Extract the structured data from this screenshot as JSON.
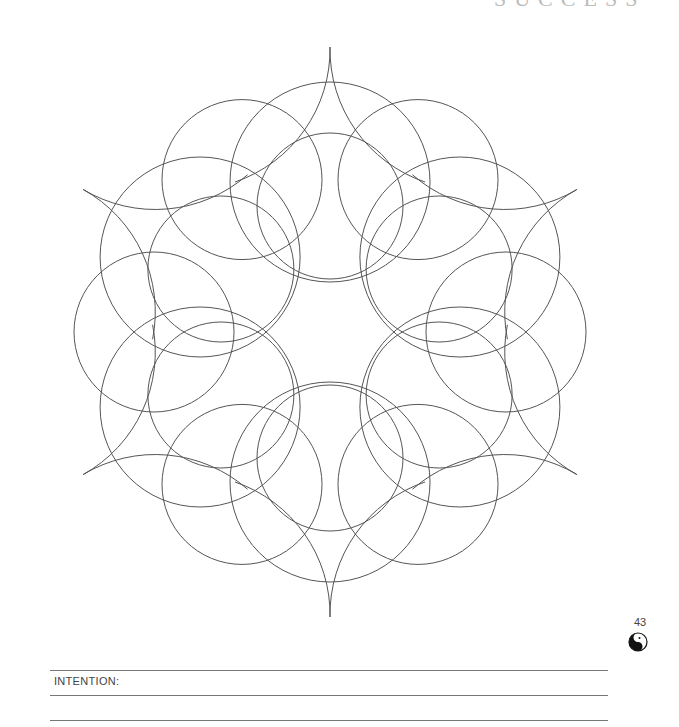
{
  "page": {
    "header_fragment": "SUCCESS",
    "page_number": "43",
    "icon": "yin-yang-face-icon",
    "intention_label": "INTENTION:",
    "line_color": "#777777",
    "stroke_color": "#555555"
  },
  "mandala": {
    "center": [
      330,
      332
    ],
    "symmetry": 6,
    "inner_circles": {
      "distance": 126,
      "radius": 73
    },
    "outer_circles": {
      "distance": 176,
      "radius": 80
    },
    "large_circles": {
      "distance": 150,
      "radius": 100
    }
  }
}
